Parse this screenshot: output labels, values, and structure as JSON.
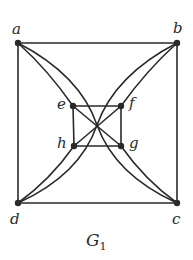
{
  "figure": {
    "caption": {
      "main": "G",
      "subscript": "1"
    },
    "colors": {
      "ink": "#2a2a2a",
      "background": "#ffffff"
    },
    "vertices": [
      {
        "id": "a",
        "label": "a",
        "x": 18,
        "y": 43
      },
      {
        "id": "b",
        "label": "b",
        "x": 177,
        "y": 43
      },
      {
        "id": "c",
        "label": "c",
        "x": 177,
        "y": 203
      },
      {
        "id": "d",
        "label": "d",
        "x": 18,
        "y": 203
      },
      {
        "id": "e",
        "label": "e",
        "x": 73,
        "y": 106
      },
      {
        "id": "f",
        "label": "f",
        "x": 121,
        "y": 106
      },
      {
        "id": "g",
        "label": "g",
        "x": 121,
        "y": 146
      },
      {
        "id": "h",
        "label": "h",
        "x": 74,
        "y": 146
      }
    ],
    "edges": [
      [
        "a",
        "b"
      ],
      [
        "b",
        "c"
      ],
      [
        "c",
        "d"
      ],
      [
        "d",
        "a"
      ],
      [
        "e",
        "f"
      ],
      [
        "f",
        "g"
      ],
      [
        "g",
        "h"
      ],
      [
        "h",
        "e"
      ],
      [
        "e",
        "g"
      ],
      [
        "f",
        "h"
      ],
      [
        "a",
        "e"
      ],
      [
        "a",
        "c"
      ],
      [
        "b",
        "f"
      ],
      [
        "b",
        "d"
      ],
      [
        "d",
        "h"
      ],
      [
        "c",
        "g"
      ]
    ]
  }
}
